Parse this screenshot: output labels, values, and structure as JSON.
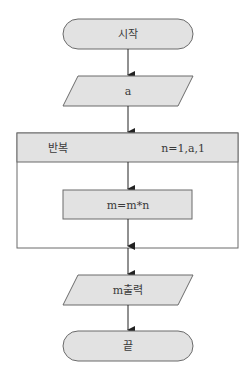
{
  "flowchart": {
    "start": {
      "label": "시작"
    },
    "input": {
      "label": "a"
    },
    "loop": {
      "label": "반복",
      "range": "n=1,a,1"
    },
    "process": {
      "label": "m=m*n"
    },
    "output": {
      "label": "m출력"
    },
    "end": {
      "label": "끝"
    }
  },
  "colors": {
    "fill": "#e2e2e2",
    "stroke": "#6b6b6b",
    "arrow": "#222222"
  }
}
